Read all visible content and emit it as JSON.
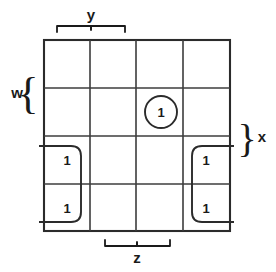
{
  "diagram": {
    "type": "karnaugh-map",
    "grid": {
      "rows": 4,
      "cols": 4,
      "left": 44,
      "top": 40,
      "right": 230,
      "bottom": 231,
      "col_edges": [
        44,
        90,
        136,
        183,
        230
      ],
      "row_edges": [
        40,
        88,
        136,
        184,
        231
      ]
    },
    "variables": [
      {
        "name": "w",
        "label": "w",
        "position": "left",
        "spans_rows": [
          0,
          1
        ],
        "brace": "{"
      },
      {
        "name": "x",
        "label": "x",
        "position": "right",
        "spans_rows": [
          1,
          2
        ],
        "brace": "}"
      },
      {
        "name": "y",
        "label": "y",
        "position": "top",
        "spans_cols": [
          0,
          1
        ],
        "brace": "bracket"
      },
      {
        "name": "z",
        "label": "z",
        "position": "bottom",
        "spans_cols": [
          1,
          2
        ],
        "brace": "bracket"
      }
    ],
    "cells": [
      {
        "row": 0,
        "col": 0,
        "value": ""
      },
      {
        "row": 0,
        "col": 1,
        "value": ""
      },
      {
        "row": 0,
        "col": 2,
        "value": ""
      },
      {
        "row": 0,
        "col": 3,
        "value": ""
      },
      {
        "row": 1,
        "col": 0,
        "value": ""
      },
      {
        "row": 1,
        "col": 1,
        "value": ""
      },
      {
        "row": 1,
        "col": 2,
        "value": "1"
      },
      {
        "row": 1,
        "col": 3,
        "value": ""
      },
      {
        "row": 2,
        "col": 0,
        "value": "1"
      },
      {
        "row": 2,
        "col": 1,
        "value": ""
      },
      {
        "row": 2,
        "col": 2,
        "value": ""
      },
      {
        "row": 2,
        "col": 3,
        "value": "1"
      },
      {
        "row": 3,
        "col": 0,
        "value": "1"
      },
      {
        "row": 3,
        "col": 1,
        "value": ""
      },
      {
        "row": 3,
        "col": 2,
        "value": ""
      },
      {
        "row": 3,
        "col": 3,
        "value": "1"
      }
    ],
    "groups": [
      {
        "id": "group-single-center",
        "shape": "oval",
        "cells": [
          {
            "row": 1,
            "col": 2
          }
        ],
        "size": 1,
        "wraps": false
      },
      {
        "id": "group-left-column",
        "shape": "rounded-rect-open-left",
        "cells": [
          {
            "row": 2,
            "col": 0
          },
          {
            "row": 3,
            "col": 0
          }
        ],
        "size": 2,
        "wraps": true
      },
      {
        "id": "group-right-column",
        "shape": "rounded-rect-open-right",
        "cells": [
          {
            "row": 2,
            "col": 3
          },
          {
            "row": 3,
            "col": 3
          }
        ],
        "size": 2,
        "wraps": true
      }
    ],
    "colors": {
      "background": "#ffffff",
      "grid_line": "#3c3c3c",
      "grid_border": "#2b2b2b",
      "group_outline": "#2b2b2b",
      "text": "#1a1a1a"
    }
  }
}
